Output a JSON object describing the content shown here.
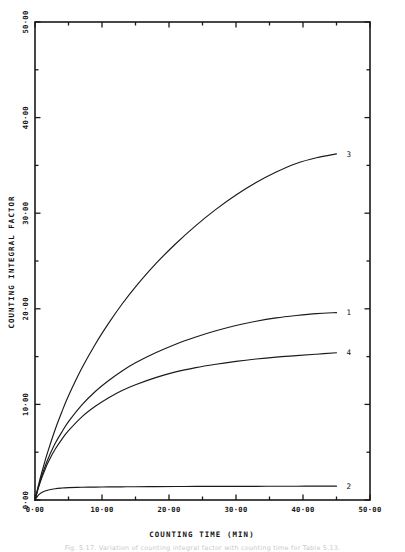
{
  "figure": {
    "background_color": "#ffffff",
    "ink_color": "#1a1a1a",
    "caption": "Fig. 5.17.  Variation of counting integral factor with counting time for Table 5.13."
  },
  "chart_data": {
    "type": "line",
    "title": "",
    "subtitle": "",
    "xlabel": "COUNTING TIME (MIN)",
    "ylabel": "COUNTING INTEGRAL FACTOR",
    "xlim": [
      0,
      50
    ],
    "ylim": [
      0,
      50
    ],
    "xticks": [
      0,
      10,
      20,
      30,
      40,
      50
    ],
    "xtick_labels": [
      "0.00",
      "10.00",
      "20.00",
      "30.00",
      "40.00",
      "50.00"
    ],
    "yticks": [
      0,
      10,
      20,
      30,
      40,
      50
    ],
    "ytick_labels": [
      "0.00",
      "10.00",
      "20.00",
      "30.00",
      "40.00",
      "50.00"
    ],
    "minor_tick_interval": 5,
    "grid": false,
    "legend": "inline-end-labels",
    "frame": "box",
    "x": [
      0,
      0.5,
      1,
      1.5,
      2,
      3,
      4,
      5,
      7,
      9,
      11,
      13,
      15,
      18,
      21,
      24,
      27,
      30,
      33,
      36,
      39,
      42,
      45
    ],
    "series": [
      {
        "name": "1",
        "label": "1",
        "end_label_value": 19.6,
        "values": [
          0.0,
          1.35,
          2.5,
          3.5,
          4.4,
          5.9,
          7.1,
          8.2,
          9.95,
          11.35,
          12.5,
          13.5,
          14.35,
          15.4,
          16.3,
          17.05,
          17.7,
          18.25,
          18.7,
          19.05,
          19.3,
          19.5,
          19.6
        ]
      },
      {
        "name": "2",
        "label": "2",
        "end_label_value": 1.45,
        "values": [
          0.0,
          0.5,
          0.78,
          0.95,
          1.05,
          1.18,
          1.25,
          1.29,
          1.33,
          1.35,
          1.37,
          1.38,
          1.39,
          1.4,
          1.41,
          1.42,
          1.42,
          1.43,
          1.43,
          1.44,
          1.44,
          1.45,
          1.45
        ]
      },
      {
        "name": "3",
        "label": "3",
        "end_label_value": 36.2,
        "values": [
          0.0,
          1.5,
          2.85,
          4.1,
          5.25,
          7.35,
          9.2,
          10.9,
          13.8,
          16.3,
          18.5,
          20.5,
          22.3,
          24.7,
          26.8,
          28.7,
          30.4,
          31.9,
          33.2,
          34.3,
          35.2,
          35.8,
          36.2
        ]
      },
      {
        "name": "4",
        "label": "4",
        "end_label_value": 15.4,
        "values": [
          0.0,
          1.25,
          2.3,
          3.2,
          4.0,
          5.3,
          6.35,
          7.25,
          8.7,
          9.8,
          10.7,
          11.45,
          12.05,
          12.8,
          13.4,
          13.85,
          14.2,
          14.5,
          14.75,
          14.95,
          15.1,
          15.25,
          15.4
        ]
      }
    ]
  }
}
